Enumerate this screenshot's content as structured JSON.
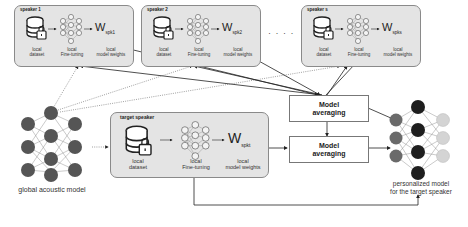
{
  "speakers": [
    {
      "title": "speaker 1",
      "dataset_label": "local\ndataset",
      "finetune_label": "local\nFine-tuning",
      "weights_label": "local\nmodel weights",
      "weight_symbol": "W",
      "weight_sub": "spk1"
    },
    {
      "title": "speaker 2",
      "dataset_label": "local\ndataset",
      "finetune_label": "local\nFine-tuning",
      "weights_label": "local\nmodel weights",
      "weight_symbol": "W",
      "weight_sub": "spk2"
    },
    {
      "title": "speaker s",
      "dataset_label": "local\ndataset",
      "finetune_label": "local\nFine-tuning",
      "weights_label": "local\nmodel weights",
      "weight_symbol": "W",
      "weight_sub": "spks"
    }
  ],
  "ellipsis": "· · · ·",
  "target": {
    "title": "target speaker",
    "dataset_label": "local\ndataset",
    "finetune_label": "local\nFine-tuning",
    "weights_label": "local\nmodel weights",
    "weight_symbol": "W",
    "weight_sub": "spkt"
  },
  "averaging": [
    {
      "label": "Model\naveraging"
    },
    {
      "label": "Model\naveraging"
    }
  ],
  "global_model": {
    "caption": "global acoustic model"
  },
  "personalized_model": {
    "caption": "personalized model\nfor the target speaker"
  },
  "colors": {
    "panel_bg": "#e4e4e4",
    "global_node": "#555555",
    "pers_in": "#6a6a6a",
    "pers_hidden": "#1e1e1e",
    "pers_out": "#d4d4d4"
  }
}
